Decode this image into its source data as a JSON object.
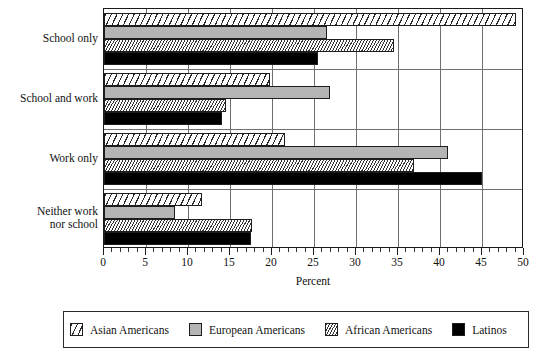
{
  "chart_data": {
    "type": "bar",
    "orientation": "horizontal",
    "title": "",
    "xlabel": "Percent",
    "ylabel": "",
    "xlim": [
      0,
      50
    ],
    "xticks": [
      0,
      5,
      10,
      15,
      20,
      25,
      30,
      35,
      40,
      45,
      50
    ],
    "xtick_labels": [
      "0",
      "5",
      "10",
      "15",
      "20",
      "25",
      "30",
      "35",
      "40",
      "45",
      "50"
    ],
    "grid": true,
    "legend_position": "bottom",
    "categories": [
      "School only",
      "School and work",
      "Work only",
      "Neither work nor school"
    ],
    "category_label_lines": [
      [
        "School only"
      ],
      [
        "School and work"
      ],
      [
        "Work only"
      ],
      [
        "Neither work",
        "nor school"
      ]
    ],
    "series": [
      {
        "name": "Asian Americans",
        "pattern": "diagonal-hatch-wide",
        "color": "#ffffff",
        "values": [
          49.0,
          19.8,
          21.5,
          11.7
        ]
      },
      {
        "name": "European Americans",
        "pattern": "solid-gray",
        "color": "#b4b4b4",
        "values": [
          26.5,
          26.9,
          41.0,
          8.4
        ]
      },
      {
        "name": "African Americans",
        "pattern": "diagonal-hatch-fine",
        "color": "#ffffff",
        "values": [
          34.5,
          14.5,
          36.9,
          17.6
        ]
      },
      {
        "name": "Latinos",
        "pattern": "solid-black",
        "color": "#000000",
        "values": [
          25.5,
          14.0,
          45.0,
          17.5
        ]
      }
    ]
  },
  "legend": {
    "items": [
      {
        "label": "Asian Americans",
        "swatch": "hatch-wide-swatch"
      },
      {
        "label": "European Americans",
        "swatch": "gray-swatch"
      },
      {
        "label": "African Americans",
        "swatch": "hatch-fine-swatch"
      },
      {
        "label": "Latinos",
        "swatch": "black-swatch"
      }
    ]
  },
  "axis": {
    "x_title": "Percent"
  }
}
